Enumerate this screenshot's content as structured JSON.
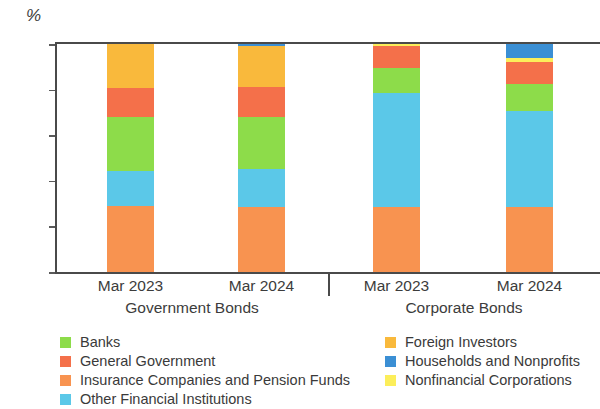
{
  "chart_data": {
    "type": "bar",
    "stacked": true,
    "percent_stacked": true,
    "title": "",
    "subtitle": "",
    "xlabel": "",
    "ylabel": "%",
    "ylim": [
      0,
      100
    ],
    "yticks": [
      0,
      20,
      40,
      60,
      80,
      100
    ],
    "ytick_labels": [
      "0",
      "20",
      "40",
      "60",
      "80",
      "100"
    ],
    "grid": false,
    "legend_position": "bottom",
    "categories": [
      "Mar 2023",
      "Mar 2024",
      "Mar 2023",
      "Mar 2024"
    ],
    "groups": [
      {
        "label": "Government Bonds",
        "categories": [
          "Mar 2023",
          "Mar 2024"
        ]
      },
      {
        "label": "Corporate Bonds",
        "categories": [
          "Mar 2023",
          "Mar 2024"
        ]
      }
    ],
    "series": [
      {
        "name": "Insurance Companies and Pension Funds",
        "color": "#f89350",
        "values": [
          29.0,
          28.5,
          28.5,
          28.5
        ]
      },
      {
        "name": "Other Financial Institutions",
        "color": "#5bc8e8",
        "values": [
          15.5,
          16.5,
          50.0,
          42.0
        ]
      },
      {
        "name": "Banks",
        "color": "#8ddc4a",
        "values": [
          23.5,
          23.0,
          11.0,
          12.0
        ]
      },
      {
        "name": "General Government",
        "color": "#f4704a",
        "values": [
          12.5,
          13.0,
          9.5,
          9.5
        ]
      },
      {
        "name": "Foreign Investors",
        "color": "#f9b93c",
        "values": [
          19.5,
          18.0,
          0.0,
          0.0
        ]
      },
      {
        "name": "Nonfinancial Corporations",
        "color": "#fcee5a",
        "values": [
          0.0,
          0.0,
          1.0,
          2.0
        ]
      },
      {
        "name": "Households and Nonprofits",
        "color": "#3b8fd4",
        "values": [
          0.0,
          1.0,
          0.0,
          6.0
        ]
      }
    ]
  },
  "axis": {
    "unit_label": "%",
    "ytick_labels": [
      "100",
      "80",
      "60",
      "40",
      "20",
      "0"
    ]
  },
  "xaxis": {
    "bar_labels": [
      "Mar 2023",
      "Mar 2024",
      "Mar 2023",
      "Mar 2024"
    ],
    "group_labels": [
      "Government Bonds",
      "Corporate Bonds"
    ]
  },
  "legend": {
    "left_column": [
      {
        "label": "Banks",
        "color": "#8ddc4a"
      },
      {
        "label": "General Government",
        "color": "#f4704a"
      },
      {
        "label": "Insurance Companies and Pension Funds",
        "color": "#f89350"
      },
      {
        "label": "Other Financial Institutions",
        "color": "#5bc8e8"
      }
    ],
    "right_column": [
      {
        "label": "Foreign Investors",
        "color": "#f9b93c"
      },
      {
        "label": "Households and Nonprofits",
        "color": "#3b8fd4"
      },
      {
        "label": "Nonfinancial Corporations",
        "color": "#fcee5a"
      }
    ]
  }
}
